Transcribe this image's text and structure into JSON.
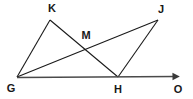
{
  "figure": {
    "type": "geometry-diagram",
    "background_color": "#ffffff",
    "stroke_color": "#1a1a1a",
    "baseline_color": "#4a4a4a",
    "width": 193,
    "height": 99
  },
  "points": {
    "G": {
      "label": "G",
      "x": 17,
      "y": 77,
      "label_x": 11,
      "label_y": 88
    },
    "K": {
      "label": "K",
      "x": 50,
      "y": 20,
      "label_x": 52,
      "label_y": 8
    },
    "M": {
      "label": "M",
      "x": 88,
      "y": 45,
      "label_x": 86,
      "label_y": 35
    },
    "J": {
      "label": "J",
      "x": 158,
      "y": 20,
      "label_x": 161,
      "label_y": 9
    },
    "H": {
      "label": "H",
      "x": 118,
      "y": 77,
      "label_x": 118,
      "label_y": 89
    },
    "O": {
      "label": "O",
      "x": 178,
      "y": 77,
      "label_x": 178,
      "label_y": 89
    }
  },
  "segments": [
    {
      "name": "segment-GK",
      "from": "G",
      "to": "K"
    },
    {
      "name": "segment-KH",
      "from": "K",
      "to": "H"
    },
    {
      "name": "segment-GJ",
      "from": "G",
      "to": "J"
    },
    {
      "name": "segment-HJ",
      "from": "H",
      "to": "J"
    }
  ],
  "rays": [
    {
      "name": "ray-GO",
      "from": "G",
      "to": "O",
      "arrowhead": true
    }
  ]
}
